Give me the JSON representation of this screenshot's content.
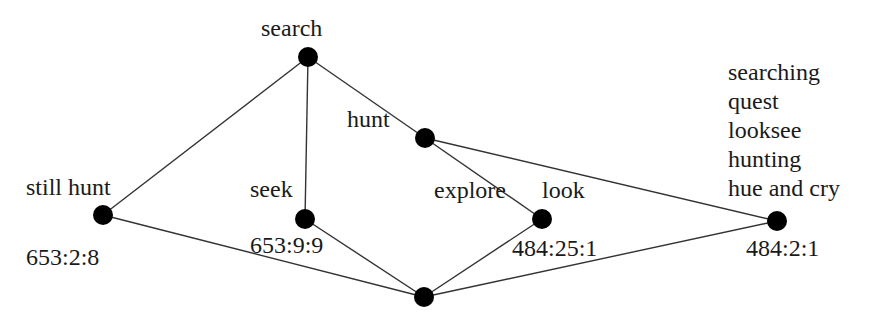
{
  "diagram": {
    "type": "lattice-graph",
    "colors": {
      "node": "#000000",
      "edge": "#333333",
      "text": "#1a1a1a",
      "background": "#ffffff"
    },
    "nodes": [
      {
        "id": "search",
        "x": 308,
        "y": 57,
        "label": "search"
      },
      {
        "id": "hunt",
        "x": 425,
        "y": 138,
        "label": "hunt"
      },
      {
        "id": "still_hunt",
        "x": 103,
        "y": 215,
        "label": "still hunt",
        "code": "653:2:8"
      },
      {
        "id": "seek",
        "x": 305,
        "y": 219,
        "label": "seek",
        "code": "653:9:9"
      },
      {
        "id": "look",
        "x": 542,
        "y": 219,
        "label_left": "explore",
        "label": "look",
        "code": "484:25:1"
      },
      {
        "id": "right",
        "x": 777,
        "y": 221,
        "labels": [
          "searching",
          "quest",
          "looksee",
          "hunting",
          "hue and cry"
        ],
        "code": "484:2:1"
      },
      {
        "id": "bottom",
        "x": 424,
        "y": 297
      }
    ],
    "edges": [
      [
        "search",
        "still_hunt"
      ],
      [
        "search",
        "seek"
      ],
      [
        "search",
        "hunt"
      ],
      [
        "hunt",
        "look"
      ],
      [
        "hunt",
        "right"
      ],
      [
        "still_hunt",
        "bottom"
      ],
      [
        "seek",
        "bottom"
      ],
      [
        "look",
        "bottom"
      ],
      [
        "bottom",
        "right"
      ]
    ]
  }
}
